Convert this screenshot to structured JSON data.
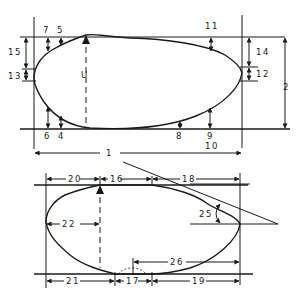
{
  "figure": {
    "stroke_color": "#1a1a1a",
    "background_color": "#ffffff"
  },
  "top_profile": {
    "labels": {
      "d7": "7",
      "d5": "5",
      "d15": "15",
      "d13": "13",
      "dU": "U",
      "d6": "6",
      "d4": "4",
      "d11": "11",
      "d14": "14",
      "d12": "12",
      "d2": "2",
      "d8": "8",
      "d9": "9",
      "d10": "10",
      "d1": "1"
    }
  },
  "bottom_profile": {
    "labels": {
      "d20": "20",
      "d16": "16",
      "d18": "18",
      "d22": "22",
      "d25": "25",
      "d26": "26",
      "d21": "21",
      "d17": "17",
      "d19": "19"
    }
  }
}
